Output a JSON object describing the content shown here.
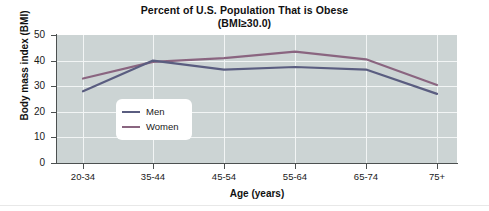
{
  "chart_data": {
    "type": "line",
    "title": "Percent of U.S. Population That is Obese",
    "subtitle": "(BMI≥30.0)",
    "xlabel": "Age (years)",
    "ylabel": "Body mass index (BMI)",
    "categories": [
      "20-34",
      "35-44",
      "45-54",
      "55-64",
      "65-74",
      "75+"
    ],
    "series": [
      {
        "name": "Men",
        "color": "#5a5d80",
        "values": [
          28,
          40,
          36.5,
          37.5,
          36.5,
          27
        ]
      },
      {
        "name": "Women",
        "color": "#8a6580",
        "values": [
          33,
          39.5,
          41,
          43.5,
          40.5,
          30.5
        ]
      }
    ],
    "ylim": [
      0,
      50
    ],
    "yticks": [
      0,
      10,
      20,
      30,
      40,
      50
    ],
    "ytick_labels": [
      "0",
      "10",
      "20",
      "30",
      "40",
      "50"
    ],
    "grid": true,
    "grid_color": "#f2f5f5",
    "plot_background": "#ccd4d4",
    "legend_position": "inside-left"
  },
  "legend": {
    "entries": [
      {
        "label": "Men"
      },
      {
        "label": "Women"
      }
    ]
  }
}
